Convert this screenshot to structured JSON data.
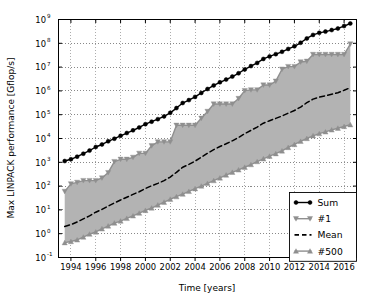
{
  "chart_data": {
    "type": "line",
    "title": "",
    "xlabel": "Time [years]",
    "ylabel": "Max LINPACK performance [Gflop/s]",
    "yscale": "log",
    "xlim": [
      1993.0,
      2017.0
    ],
    "ylim": [
      0.1,
      1000000000
    ],
    "grid": true,
    "grid_style": "dotted",
    "legend_position": "lower right",
    "xticks": [
      1994,
      1996,
      1998,
      2000,
      2002,
      2004,
      2006,
      2008,
      2010,
      2012,
      2014,
      2016
    ],
    "xtick_labels": [
      "1994",
      "1996",
      "1998",
      "2000",
      "2002",
      "2004",
      "2006",
      "2008",
      "2010",
      "2012",
      "2014",
      "2016"
    ],
    "yticks": [
      0.1,
      1,
      10,
      100,
      1000,
      10000,
      100000,
      1000000,
      10000000,
      100000000,
      1000000000
    ],
    "ytick_labels": [
      "10-1",
      "100",
      "101",
      "102",
      "103",
      "104",
      "105",
      "106",
      "107",
      "108",
      "109"
    ],
    "ytick_mantissa": "10",
    "ytick_exponents": [
      "-1",
      "0",
      "1",
      "2",
      "3",
      "4",
      "5",
      "6",
      "7",
      "8",
      "9"
    ],
    "band_between": [
      "#1",
      "#500"
    ],
    "band_color": "#b3b3b3",
    "x": [
      1993.5,
      1994.0,
      1994.5,
      1995.0,
      1995.5,
      1996.0,
      1996.5,
      1997.0,
      1997.5,
      1998.0,
      1998.5,
      1999.0,
      1999.5,
      2000.0,
      2000.5,
      2001.0,
      2001.5,
      2002.0,
      2002.5,
      2003.0,
      2003.5,
      2004.0,
      2004.5,
      2005.0,
      2005.5,
      2006.0,
      2006.5,
      2007.0,
      2007.5,
      2008.0,
      2008.5,
      2009.0,
      2009.5,
      2010.0,
      2010.5,
      2011.0,
      2011.5,
      2012.0,
      2012.5,
      2013.0,
      2013.5,
      2014.0,
      2014.5,
      2015.0,
      2015.5,
      2016.0,
      2016.5
    ],
    "series": [
      {
        "name": "Sum",
        "color": "#000000",
        "marker": "circle",
        "linestyle": "solid",
        "values": [
          1130,
          1340,
          1730,
          2300,
          3100,
          4400,
          5600,
          7600,
          9800,
          13000,
          17000,
          22000,
          29000,
          40000,
          51000,
          65000,
          85000,
          120000,
          190000,
          310000,
          410000,
          560000,
          820000,
          1200000,
          1700000,
          2300000,
          3000000,
          4000000,
          5500000,
          8000000,
          11000000,
          15000000,
          22000000,
          28000000,
          35000000,
          44000000,
          58000000,
          75000000,
          105000000,
          160000000,
          225000000,
          275000000,
          310000000,
          360000000,
          420000000,
          530000000,
          680000000
        ]
      },
      {
        "name": "#1",
        "color": "#8f8f8f",
        "marker": "triangle-down",
        "linestyle": "solid",
        "values": [
          59.7,
          124,
          143,
          170,
          170,
          170,
          220,
          368,
          1068,
          1338,
          1338,
          1608,
          2379,
          2379,
          4938,
          7226,
          7226,
          7226,
          35860,
          35860,
          35860,
          35860,
          70720,
          136800,
          280600,
          280600,
          280600,
          280600,
          478200,
          1026000,
          1105000,
          1105000,
          1759000,
          1759000,
          2566000,
          8162000,
          10510000,
          10510000,
          16320000,
          17590000,
          33860000,
          33860000,
          33860000,
          33860000,
          33860000,
          33860000,
          93010000
        ]
      },
      {
        "name": "Mean",
        "color": "#000000",
        "marker": "none",
        "linestyle": "dashed",
        "values": [
          2.0,
          2.4,
          3.1,
          4.2,
          5.6,
          8.0,
          10.5,
          14.5,
          19.5,
          26.0,
          34.0,
          45.0,
          58.0,
          80.0,
          103.0,
          130.0,
          170.0,
          240.0,
          380.0,
          620.0,
          820.0,
          1120.0,
          1640.0,
          2400.0,
          3400.0,
          4600.0,
          6000.0,
          8000.0,
          11000.0,
          16000.0,
          22000.0,
          30000.0,
          44000.0,
          56000.0,
          70000.0,
          88000.0,
          116000.0,
          150000.0,
          210000.0,
          320000.0,
          450000.0,
          550000.0,
          620000.0,
          720000.0,
          840000.0,
          1060000.0,
          1360000.0
        ]
      },
      {
        "name": "#500",
        "color": "#8f8f8f",
        "marker": "triangle-up",
        "linestyle": "solid",
        "values": [
          0.42,
          0.47,
          0.55,
          0.72,
          0.96,
          1.18,
          1.6,
          2.1,
          2.8,
          3.4,
          4.4,
          5.6,
          7.3,
          9.5,
          12.0,
          16.0,
          21.0,
          28.0,
          36.0,
          46.0,
          60.0,
          78.0,
          100.0,
          130.0,
          170.0,
          220.0,
          290.0,
          380.0,
          480.0,
          620.0,
          800.0,
          1070.0,
          1400.0,
          1800.0,
          2300.0,
          3000.0,
          4200.0,
          5600.0,
          7600.0,
          10000.0,
          13000.0,
          16000.0,
          19000.0,
          23000.0,
          27000.0,
          32000.0,
          38000.0
        ]
      }
    ]
  },
  "legend": {
    "entries": [
      {
        "label": "Sum"
      },
      {
        "label": "#1"
      },
      {
        "label": "Mean"
      },
      {
        "label": "#500"
      }
    ]
  },
  "axes": {
    "xlabel": "Time [years]",
    "ylabel": "Max LINPACK performance [Gflop/s]"
  }
}
